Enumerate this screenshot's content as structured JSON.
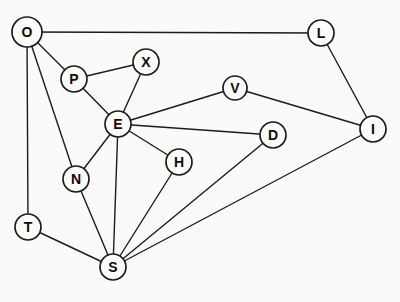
{
  "diagram": {
    "type": "undirected-graph",
    "canvas": {
      "width": 400,
      "height": 302,
      "background": "#fafaf8"
    },
    "style": {
      "edge_color": "#1c1c1c",
      "edge_width": 1.4,
      "node_stroke": "#1c1c1c",
      "node_stroke_width": 1.7,
      "node_fill": "#fcfcfa",
      "label_color": "#0d0d0d"
    },
    "nodes": [
      {
        "id": "O",
        "label": "O",
        "x": 27,
        "y": 32,
        "r": 15
      },
      {
        "id": "L",
        "label": "L",
        "x": 321,
        "y": 33,
        "r": 13
      },
      {
        "id": "P",
        "label": "P",
        "x": 74,
        "y": 79,
        "r": 13
      },
      {
        "id": "X",
        "label": "X",
        "x": 146,
        "y": 62,
        "r": 13
      },
      {
        "id": "V",
        "label": "V",
        "x": 235,
        "y": 88,
        "r": 12
      },
      {
        "id": "E",
        "label": "E",
        "x": 118,
        "y": 124,
        "r": 13
      },
      {
        "id": "D",
        "label": "D",
        "x": 273,
        "y": 135,
        "r": 13
      },
      {
        "id": "I",
        "label": "I",
        "x": 373,
        "y": 129,
        "r": 13
      },
      {
        "id": "H",
        "label": "H",
        "x": 179,
        "y": 162,
        "r": 13
      },
      {
        "id": "N",
        "label": "N",
        "x": 76,
        "y": 179,
        "r": 13
      },
      {
        "id": "T",
        "label": "T",
        "x": 28,
        "y": 227,
        "r": 13
      },
      {
        "id": "S",
        "label": "S",
        "x": 113,
        "y": 267,
        "r": 13
      }
    ],
    "edges": [
      [
        "O",
        "L"
      ],
      [
        "O",
        "P"
      ],
      [
        "O",
        "N"
      ],
      [
        "O",
        "T"
      ],
      [
        "L",
        "I"
      ],
      [
        "P",
        "X"
      ],
      [
        "P",
        "E"
      ],
      [
        "X",
        "E"
      ],
      [
        "E",
        "V"
      ],
      [
        "E",
        "D"
      ],
      [
        "E",
        "H"
      ],
      [
        "E",
        "N"
      ],
      [
        "E",
        "S"
      ],
      [
        "V",
        "I"
      ],
      [
        "D",
        "S"
      ],
      [
        "H",
        "S"
      ],
      [
        "N",
        "S"
      ],
      [
        "T",
        "S"
      ],
      [
        "I",
        "S"
      ]
    ]
  }
}
